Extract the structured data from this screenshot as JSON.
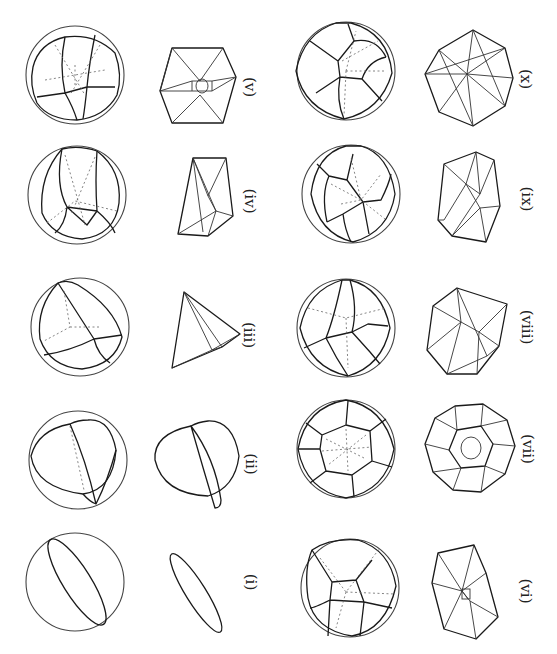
{
  "figure": {
    "orientation": "rotated 90 degrees clockwise",
    "background": "#ffffff",
    "line_color": "#1a1a1a",
    "panels": [
      {
        "id": "i",
        "label": "(i)",
        "sphere": {
          "cx": 75,
          "cy": 582,
          "r": 50
        },
        "poly": {
          "cx": 195,
          "cy": 590
        },
        "label_pos": {
          "x": 252,
          "y": 580
        },
        "shape": "single great-circle ellipse"
      },
      {
        "id": "ii",
        "label": "(ii)",
        "sphere": {
          "cx": 77,
          "cy": 460,
          "r": 50
        },
        "poly": {
          "cx": 200,
          "cy": 462
        },
        "label_pos": {
          "x": 252,
          "y": 462
        },
        "shape": "lens / two-face partition"
      },
      {
        "id": "iii",
        "label": "(iii)",
        "sphere": {
          "cx": 80,
          "cy": 327,
          "r": 50
        },
        "poly": {
          "cx": 205,
          "cy": 330
        },
        "label_pos": {
          "x": 252,
          "y": 333
        },
        "shape": "tetrahedron"
      },
      {
        "id": "iv",
        "label": "(iv)",
        "sphere": {
          "cx": 77,
          "cy": 195,
          "r": 50
        },
        "poly": {
          "cx": 205,
          "cy": 196
        },
        "label_pos": {
          "x": 252,
          "y": 202
        },
        "shape": "triangular prism"
      },
      {
        "id": "v",
        "label": "(v)",
        "sphere": {
          "cx": 75,
          "cy": 75,
          "r": 50
        },
        "poly": {
          "cx": 198,
          "cy": 85
        },
        "label_pos": {
          "x": 252,
          "y": 88
        },
        "shape": "cube"
      },
      {
        "id": "vi",
        "label": "(vi)",
        "sphere": {
          "cx": 349,
          "cy": 587,
          "r": 49
        },
        "poly": {
          "cx": 467,
          "cy": 586
        },
        "label_pos": {
          "x": 520,
          "y": 590
        },
        "shape": "pentagonal prism"
      },
      {
        "id": "vii",
        "label": "(vii)",
        "sphere": {
          "cx": 345,
          "cy": 448,
          "r": 49
        },
        "poly": {
          "cx": 470,
          "cy": 448
        },
        "label_pos": {
          "x": 520,
          "y": 448
        },
        "shape": "dodecahedron"
      },
      {
        "id": "viii",
        "label": "(viii)",
        "sphere": {
          "cx": 345,
          "cy": 327,
          "r": 49
        },
        "poly": {
          "cx": 467,
          "cy": 330
        },
        "label_pos": {
          "x": 520,
          "y": 328
        },
        "shape": "polyhedron, 8 faces"
      },
      {
        "id": "ix",
        "label": "(ix)",
        "sphere": {
          "cx": 350,
          "cy": 193,
          "r": 49
        },
        "poly": {
          "cx": 470,
          "cy": 196
        },
        "label_pos": {
          "x": 522,
          "y": 200
        },
        "shape": "polyhedron, 9 faces"
      },
      {
        "id": "x",
        "label": "(x)",
        "sphere": {
          "cx": 345,
          "cy": 70,
          "r": 49
        },
        "poly": {
          "cx": 470,
          "cy": 80
        },
        "label_pos": {
          "x": 522,
          "y": 80
        },
        "shape": "polyhedron, 10 faces"
      }
    ]
  }
}
